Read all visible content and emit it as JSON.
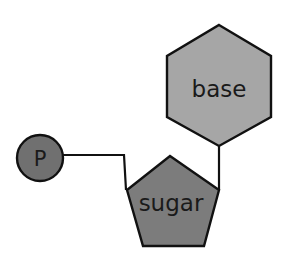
{
  "diagram": {
    "nodes": [
      {
        "id": "phosphate",
        "shape": "circle",
        "label": "P",
        "fill": "#707070"
      },
      {
        "id": "sugar",
        "shape": "pentagon",
        "label": "sugar",
        "fill": "#7c7c7c"
      },
      {
        "id": "base",
        "shape": "hexagon",
        "label": "base",
        "fill": "#a6a6a6"
      }
    ],
    "edges": [
      {
        "from": "phosphate",
        "to": "sugar"
      },
      {
        "from": "sugar",
        "to": "base"
      }
    ],
    "stroke_color": "#111111"
  }
}
